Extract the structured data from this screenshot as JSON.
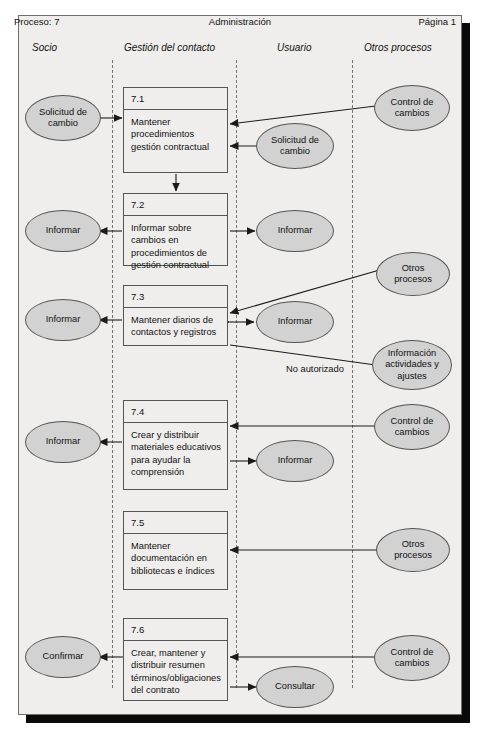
{
  "page": {
    "process_label": "Proceso: 7",
    "title": "Administración",
    "page_label": "Página 1"
  },
  "lanes": [
    {
      "name": "socio",
      "label": "Socio",
      "x": 24
    },
    {
      "name": "gestion-del-contacto",
      "label": "Gestión del contacto",
      "x": 124
    },
    {
      "name": "usuario",
      "label": "Usuario",
      "x": 276
    },
    {
      "name": "otros-procesos",
      "label": "Otros procesos",
      "x": 363
    }
  ],
  "lane_separators": [
    112,
    236,
    352
  ],
  "processes": [
    {
      "id": "7.1",
      "number": "7.1",
      "text": "Mantener procedimientos gestión contractual"
    },
    {
      "id": "7.2",
      "number": "7.2",
      "text": "Informar sobre cambios en procedimientos de gestión contractual"
    },
    {
      "id": "7.3",
      "number": "7.3",
      "text": "Mantener diarios de contactos y registros"
    },
    {
      "id": "7.4",
      "number": "7.4",
      "text": "Crear y distribuir materiales educativos para ayudar la comprensión"
    },
    {
      "id": "7.5",
      "number": "7.5",
      "text": "Mantener documentación en bibliotecas e índices"
    },
    {
      "id": "7.6",
      "number": "7.6",
      "text": "Crear, mantener y distribuir resumen términos/obligaciones del contrato"
    }
  ],
  "entities": [
    {
      "id": "e1",
      "lane": "socio",
      "label": "Solicitud de cambio"
    },
    {
      "id": "e2",
      "lane": "socio",
      "label": "Informar"
    },
    {
      "id": "e3",
      "lane": "socio",
      "label": "Informar"
    },
    {
      "id": "e4",
      "lane": "socio",
      "label": "Informar"
    },
    {
      "id": "e5",
      "lane": "socio",
      "label": "Confirmar"
    },
    {
      "id": "e6",
      "lane": "usuario",
      "label": "Solicitud de cambio"
    },
    {
      "id": "e7",
      "lane": "usuario",
      "label": "Informar"
    },
    {
      "id": "e8",
      "lane": "usuario",
      "label": "Informar"
    },
    {
      "id": "e9",
      "lane": "usuario",
      "label": "Informar"
    },
    {
      "id": "e10",
      "lane": "usuario",
      "label": "Consultar"
    },
    {
      "id": "e11",
      "lane": "otros-procesos",
      "label": "Control de cambios"
    },
    {
      "id": "e12",
      "lane": "otros-procesos",
      "label": "Otros procesos"
    },
    {
      "id": "e13",
      "lane": "otros-procesos",
      "label": "Información actividades y ajustes"
    },
    {
      "id": "e14",
      "lane": "otros-procesos",
      "label": "Control de cambios"
    },
    {
      "id": "e15",
      "lane": "otros-procesos",
      "label": "Otros procesos"
    },
    {
      "id": "e16",
      "lane": "otros-procesos",
      "label": "Control de cambios"
    }
  ],
  "edge_labels": [
    {
      "id": "no-autorizado",
      "text": "No autorizado"
    }
  ],
  "colors": {
    "sheet_background": "#efeeec",
    "ellipse_fill": "#d2d2d2",
    "stroke": "#555555",
    "lane_separator": "#777777",
    "shadow": "#0a0a0a"
  }
}
